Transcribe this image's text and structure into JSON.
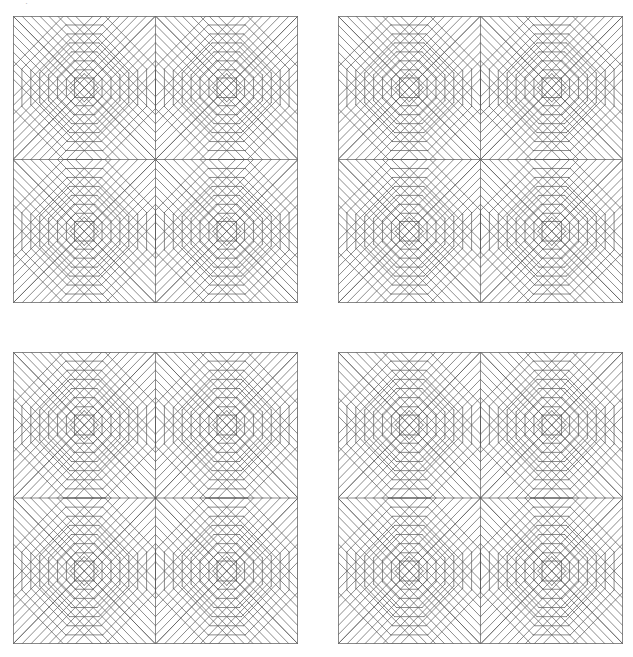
{
  "figure": {
    "title": "",
    "kind": "quilt-pattern-grid",
    "canvas": {
      "width": 633,
      "height": 657,
      "background": "#ffffff"
    },
    "stroke": {
      "color": "#5a5a5a",
      "width": 0.7,
      "frame_color": "#6b6b6b",
      "frame_width": 0.8
    },
    "grid": {
      "rows": 2,
      "cols": 2,
      "panel_count": 4
    },
    "top_artifact": {
      "visible": true,
      "glyph": "·"
    },
    "panels": [
      {
        "id": "panel-top-left",
        "label": "Quilt panel 1",
        "x": 13,
        "y": 16,
        "width": 285,
        "height": 287,
        "blocks": 4
      },
      {
        "id": "panel-top-right",
        "label": "Quilt panel 2",
        "x": 338,
        "y": 16,
        "width": 285,
        "height": 287,
        "blocks": 4
      },
      {
        "id": "panel-bottom-left",
        "label": "Quilt panel 3",
        "x": 13,
        "y": 352,
        "width": 285,
        "height": 292,
        "blocks": 4
      },
      {
        "id": "panel-bottom-right",
        "label": "Quilt panel 4",
        "x": 338,
        "y": 352,
        "width": 285,
        "height": 292,
        "blocks": 4
      }
    ],
    "block": {
      "name": "pineapple-log-cabin-block",
      "arrangement": "2x2 mirrored",
      "ring_count": 8,
      "description": "Concentric octagonal rings of alternating straight and diagonal strips around a central square set with an inscribed diamond."
    }
  },
  "chart_data": {
    "type": "diagram",
    "title": "",
    "xlabel": "",
    "ylabel": "",
    "categories": [],
    "values": []
  }
}
